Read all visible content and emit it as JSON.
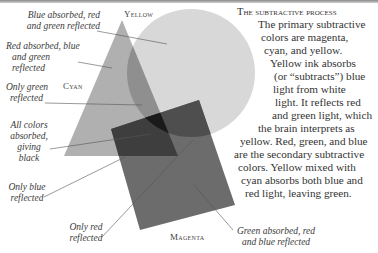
{
  "title": "The subtractive process",
  "body_lines": [
    "The primary subtractive",
    "colors are magenta,",
    "cyan, and yellow.",
    "Yellow ink absorbs",
    "(or “subtracts”) blue",
    "light from white",
    "light. It reflects red",
    "and green light, which",
    "the brain interprets as",
    "yellow. Red, green, and blue",
    "are the secondary subtractive",
    "colors. Yellow mixed with",
    "cyan absorbs both blue and",
    "red light, leaving green."
  ],
  "shape_labels": {
    "yellow": "Yellow",
    "cyan": "Cyan",
    "magenta": "Magenta"
  },
  "callouts": {
    "blue_absorbed": [
      "Blue absorbed, red",
      "and green reflected"
    ],
    "red_absorbed": [
      "Red absorbed, blue",
      "and green reflected"
    ],
    "only_green": [
      "Only green",
      "reflected"
    ],
    "all_absorbed": [
      "All colors",
      "absorbed,",
      "giving black"
    ],
    "only_blue": [
      "Only blue",
      "reflected"
    ],
    "only_red": [
      "Only red",
      "reflected"
    ],
    "green_absorbed": [
      "Green absorbed, red",
      "and blue reflected"
    ]
  },
  "colors": {
    "yellow_fill": "#d6d6d6",
    "cyan_fill": "#a8a8a8",
    "magenta_fill": "#6e6e6e",
    "leader": "#555555"
  }
}
